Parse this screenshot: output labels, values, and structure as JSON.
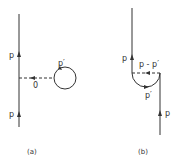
{
  "colors": {
    "line": "#333333",
    "background": "#ffffff"
  },
  "panel_a": {
    "caption": "(a)",
    "fermion_upper_label": "p",
    "fermion_lower_label": "p",
    "boson_label": "0",
    "loop_label": "p′"
  },
  "panel_b": {
    "caption": "(b)",
    "fermion_upper_label": "p",
    "fermion_lower_label": "p",
    "boson_label": "p - p′",
    "loop_label": "p′"
  }
}
